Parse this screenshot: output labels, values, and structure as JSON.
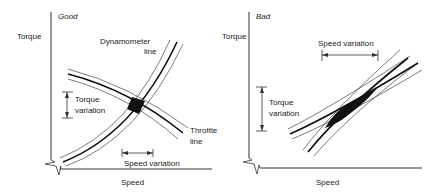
{
  "panels": [
    {
      "title": "Good",
      "y_label": "Torque",
      "x_label": "Speed",
      "annotations": {
        "dynamometer_line": [
          "Dynamometer",
          "line"
        ],
        "throttle_line": [
          "Throttle",
          "line"
        ],
        "torque_variation": [
          "Torque",
          "variation"
        ],
        "speed_variation": "Speed variation"
      }
    },
    {
      "title": "Bad",
      "y_label": "Torque",
      "x_label": "Speed",
      "annotations": {
        "torque_variation": [
          "Torque",
          "variation"
        ],
        "speed_variation": "Speed variation"
      }
    }
  ]
}
